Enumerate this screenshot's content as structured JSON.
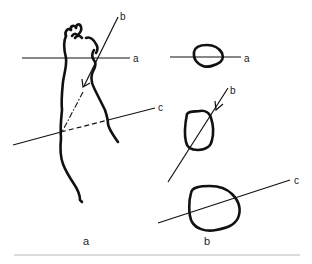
{
  "figure": {
    "panels": [
      {
        "id": "a",
        "caption": "a",
        "description": "Whole limb with section planes",
        "planes": [
          {
            "id": "a",
            "label": "a",
            "orientation": "transverse"
          },
          {
            "id": "b",
            "label": "b",
            "orientation": "oblique, arrow indicates viewing direction"
          },
          {
            "id": "c",
            "label": "c",
            "orientation": "oblique"
          }
        ]
      },
      {
        "id": "b",
        "caption": "b",
        "description": "Cross-sectional outlines cut by each plane",
        "sections": [
          {
            "id": "a",
            "label": "a"
          },
          {
            "id": "b",
            "label": "b"
          },
          {
            "id": "c",
            "label": "c"
          }
        ]
      }
    ],
    "colors": {
      "stroke": "#111111",
      "text": "#222222",
      "rule": "#b8b8b8",
      "background": "#ffffff"
    }
  }
}
